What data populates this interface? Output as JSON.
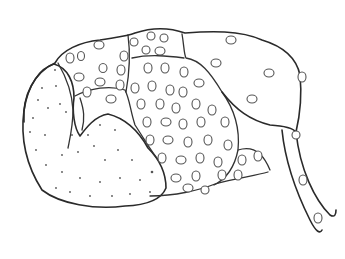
{
  "figure": {
    "type": "biological line drawing",
    "colors": {
      "stroke": "#2a2a2a",
      "background": "#ffffff"
    },
    "regions": [
      {
        "name": "stippled-lobe",
        "pattern": "stipple"
      },
      {
        "name": "upper-left-lobe",
        "pattern": "oval-cells"
      },
      {
        "name": "central-lobe",
        "pattern": "oval-cells"
      },
      {
        "name": "lower-middle-lobe",
        "pattern": "oval-cells"
      },
      {
        "name": "right-sac",
        "pattern": "sparse-oval-cells"
      },
      {
        "name": "tail-duct",
        "pattern": "sparse-oval-cells"
      }
    ]
  }
}
